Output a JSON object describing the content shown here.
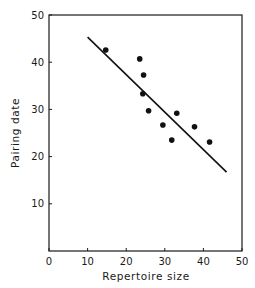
{
  "chart_data": {
    "type": "scatter",
    "title": "",
    "xlabel": "Repertoire size",
    "ylabel": "Pairing date",
    "xlim": [
      0,
      50
    ],
    "ylim": [
      0,
      50
    ],
    "x_ticks": [
      0,
      10,
      20,
      30,
      40,
      50
    ],
    "y_ticks": [
      10,
      20,
      30,
      40,
      50
    ],
    "grid": false,
    "legend": null,
    "series": [
      {
        "name": "Observations",
        "x": [
          14.7,
          23.5,
          24.5,
          24.3,
          25.8,
          33.1,
          29.5,
          37.7,
          31.8,
          41.6
        ],
        "y": [
          42.6,
          40.7,
          37.3,
          33.3,
          29.7,
          29.2,
          26.7,
          26.3,
          23.5,
          23.1
        ]
      }
    ],
    "regression_line": {
      "x": [
        10,
        46
      ],
      "y": [
        45.3,
        16.7
      ]
    }
  },
  "axes": {
    "x_title": "Repertoire size",
    "y_title": "Pairing date",
    "x_tick_labels": [
      "0",
      "10",
      "20",
      "30",
      "40",
      "50"
    ],
    "y_tick_labels": [
      "10",
      "20",
      "30",
      "40",
      "50"
    ]
  }
}
